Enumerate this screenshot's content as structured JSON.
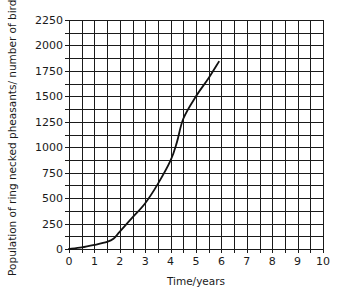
{
  "chart_data": {
    "type": "line",
    "title": "",
    "xlabel": "Time/years",
    "ylabel": "Population of ring necked pheasants/ number of birds",
    "xlim": [
      0,
      10
    ],
    "ylim": [
      0,
      2250
    ],
    "x_ticks": [
      0,
      1,
      2,
      3,
      4,
      5,
      6,
      7,
      8,
      9,
      10
    ],
    "y_ticks": [
      0,
      250,
      500,
      750,
      1000,
      1250,
      1500,
      1750,
      2000,
      2250
    ],
    "grid": true,
    "grid_x_step": 0.5,
    "grid_y_step": 125,
    "legend": null,
    "series": [
      {
        "name": "Ring necked pheasant population",
        "x": [
          0,
          0.5,
          1,
          1.5,
          1.75,
          2,
          2.5,
          3,
          3.5,
          4,
          4.25,
          4.5,
          5,
          5.5,
          5.9
        ],
        "values": [
          0,
          15,
          40,
          70,
          100,
          170,
          310,
          450,
          640,
          870,
          1050,
          1280,
          1500,
          1680,
          1840
        ]
      }
    ]
  },
  "colors": {
    "grid": "#1a1a1a",
    "line": "#111111",
    "background": "#ffffff"
  }
}
